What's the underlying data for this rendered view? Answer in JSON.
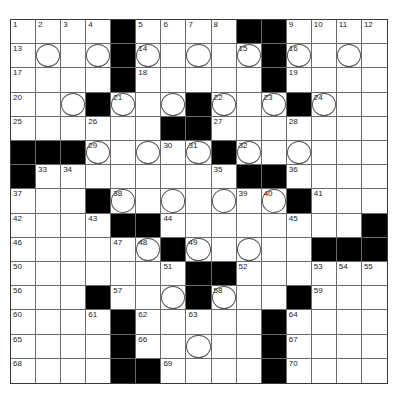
{
  "puzzle": {
    "type": "crossword",
    "rows": 15,
    "cols": 15,
    "legend": {
      "#": "black square",
      ".": "empty white square",
      "o": "circled square",
      "number": "clue number",
      "number+o": "numbered circled square"
    },
    "grid": [
      [
        "1",
        "2",
        "3",
        "4",
        "#",
        "5",
        "6",
        "7",
        "8",
        "#",
        "#",
        "9",
        "10",
        "11",
        "12"
      ],
      [
        "13",
        "o",
        ".",
        "o",
        "#",
        "14o",
        ".",
        "o",
        ".",
        "15o",
        "#",
        "16o",
        ".",
        "o",
        "."
      ],
      [
        "17",
        ".",
        ".",
        ".",
        "#",
        "18",
        ".",
        ".",
        ".",
        ".",
        "#",
        "19",
        ".",
        ".",
        "."
      ],
      [
        "20",
        ".",
        "o",
        "#",
        "21o",
        ".",
        "o",
        "#",
        "22o",
        ".",
        "23o",
        "#",
        "24o",
        ".",
        "."
      ],
      [
        "25",
        ".",
        ".",
        "26",
        ".",
        ".",
        "#",
        "#",
        "27",
        ".",
        ".",
        "28",
        ".",
        ".",
        "."
      ],
      [
        "#",
        "#",
        "#",
        "29o",
        ".",
        "o",
        "30",
        "31o",
        "#",
        "32o",
        ".",
        "o",
        ".",
        ".",
        "."
      ],
      [
        "#",
        "33",
        "34",
        ".",
        ".",
        ".",
        ".",
        ".",
        "35",
        "#",
        "#",
        "36",
        ".",
        ".",
        "."
      ],
      [
        "37",
        ".",
        ".",
        "#",
        "38o",
        ".",
        "o",
        ".",
        "o",
        "39",
        "40o",
        "#",
        "41",
        ".",
        "."
      ],
      [
        "42",
        ".",
        ".",
        "43",
        "#",
        "#",
        "44",
        ".",
        ".",
        ".",
        ".",
        "45",
        ".",
        ".",
        "#"
      ],
      [
        "46",
        ".",
        ".",
        ".",
        "47",
        "48o",
        "#",
        "49o",
        ".",
        "o",
        ".",
        ".",
        "#",
        "#",
        "#"
      ],
      [
        "50",
        ".",
        ".",
        ".",
        ".",
        ".",
        "51",
        "#",
        "#",
        "52",
        ".",
        ".",
        "53",
        "54",
        "55"
      ],
      [
        "56",
        ".",
        ".",
        "#",
        "57",
        ".",
        "o",
        "#",
        "58o",
        ".",
        ".",
        "#",
        "59",
        ".",
        "."
      ],
      [
        "60",
        ".",
        ".",
        "61",
        "#",
        "62",
        ".",
        "63",
        ".",
        ".",
        "#",
        "64",
        ".",
        ".",
        "."
      ],
      [
        "65",
        ".",
        ".",
        ".",
        "#",
        "66",
        ".",
        "o",
        ".",
        ".",
        "#",
        "67",
        ".",
        ".",
        "."
      ],
      [
        "68",
        ".",
        ".",
        ".",
        "#",
        "#",
        "69",
        ".",
        ".",
        ".",
        "#",
        "70",
        ".",
        ".",
        "."
      ]
    ]
  },
  "colors": {
    "block": "#000000",
    "cell": "#ffffff",
    "line": "#6a6a6a",
    "number": "#222222"
  }
}
